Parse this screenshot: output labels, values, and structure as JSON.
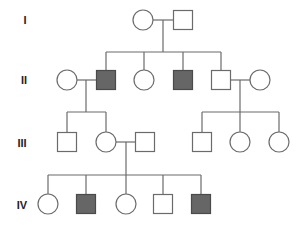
{
  "diagram": {
    "type": "pedigree",
    "colors": {
      "line": "#6b6b6b",
      "affected_fill": "#666666",
      "unaffected_fill": "#ffffff",
      "label": "#222222"
    },
    "generation_labels": [
      {
        "label": "I",
        "x": 25,
        "y": 20
      },
      {
        "label": "II",
        "x": 24,
        "y": 80
      },
      {
        "label": "III",
        "x": 22,
        "y": 143
      },
      {
        "label": "IV",
        "x": 22,
        "y": 205
      }
    ],
    "individuals": [
      {
        "id": "I-1",
        "sex": "female",
        "affected": false,
        "x": 143,
        "y": 20
      },
      {
        "id": "I-2",
        "sex": "male",
        "affected": false,
        "x": 183,
        "y": 20
      },
      {
        "id": "II-1",
        "sex": "female",
        "affected": false,
        "x": 67,
        "y": 80
      },
      {
        "id": "II-2",
        "sex": "male",
        "affected": true,
        "x": 106,
        "y": 80
      },
      {
        "id": "II-3",
        "sex": "female",
        "affected": false,
        "x": 144,
        "y": 80
      },
      {
        "id": "II-4",
        "sex": "male",
        "affected": true,
        "x": 183,
        "y": 80
      },
      {
        "id": "II-5",
        "sex": "male",
        "affected": false,
        "x": 221,
        "y": 80
      },
      {
        "id": "II-6",
        "sex": "female",
        "affected": false,
        "x": 260,
        "y": 80
      },
      {
        "id": "III-1",
        "sex": "male",
        "affected": false,
        "x": 67,
        "y": 142
      },
      {
        "id": "III-2",
        "sex": "female",
        "affected": false,
        "x": 106,
        "y": 142
      },
      {
        "id": "III-3",
        "sex": "male",
        "affected": false,
        "x": 145,
        "y": 142
      },
      {
        "id": "III-4",
        "sex": "male",
        "affected": false,
        "x": 202,
        "y": 142
      },
      {
        "id": "III-5",
        "sex": "female",
        "affected": false,
        "x": 240,
        "y": 142
      },
      {
        "id": "III-6",
        "sex": "female",
        "affected": false,
        "x": 279,
        "y": 142
      },
      {
        "id": "IV-1",
        "sex": "female",
        "affected": false,
        "x": 48,
        "y": 204
      },
      {
        "id": "IV-2",
        "sex": "male",
        "affected": true,
        "x": 86,
        "y": 204
      },
      {
        "id": "IV-3",
        "sex": "female",
        "affected": false,
        "x": 126,
        "y": 204
      },
      {
        "id": "IV-4",
        "sex": "male",
        "affected": false,
        "x": 163,
        "y": 204
      },
      {
        "id": "IV-5",
        "sex": "male",
        "affected": true,
        "x": 201,
        "y": 204
      }
    ],
    "lines": [
      {
        "name": "marriage-I",
        "x1": 153,
        "y1": 20,
        "x2": 173,
        "y2": 20
      },
      {
        "name": "descent-I",
        "x1": 163,
        "y1": 20,
        "x2": 163,
        "y2": 52
      },
      {
        "name": "sibship-II",
        "x1": 106,
        "y1": 52,
        "x2": 221,
        "y2": 52
      },
      {
        "name": "drop-II-2",
        "x1": 106,
        "y1": 52,
        "x2": 106,
        "y2": 71
      },
      {
        "name": "drop-II-3",
        "x1": 144,
        "y1": 52,
        "x2": 144,
        "y2": 70
      },
      {
        "name": "drop-II-4",
        "x1": 183,
        "y1": 52,
        "x2": 183,
        "y2": 71
      },
      {
        "name": "drop-II-5",
        "x1": 221,
        "y1": 52,
        "x2": 221,
        "y2": 71
      },
      {
        "name": "marriage-II-1-2",
        "x1": 77,
        "y1": 80,
        "x2": 97,
        "y2": 80
      },
      {
        "name": "descent-II-1-2",
        "x1": 86,
        "y1": 80,
        "x2": 86,
        "y2": 112
      },
      {
        "name": "sibship-III-left",
        "x1": 67,
        "y1": 112,
        "x2": 106,
        "y2": 112
      },
      {
        "name": "drop-III-1",
        "x1": 67,
        "y1": 112,
        "x2": 67,
        "y2": 133
      },
      {
        "name": "drop-III-2",
        "x1": 106,
        "y1": 112,
        "x2": 106,
        "y2": 132
      },
      {
        "name": "marriage-II-5-6",
        "x1": 230,
        "y1": 80,
        "x2": 250,
        "y2": 80
      },
      {
        "name": "descent-II-5-6",
        "x1": 240,
        "y1": 80,
        "x2": 240,
        "y2": 112
      },
      {
        "name": "sibship-III-right",
        "x1": 202,
        "y1": 112,
        "x2": 279,
        "y2": 112
      },
      {
        "name": "drop-III-4",
        "x1": 202,
        "y1": 112,
        "x2": 202,
        "y2": 133
      },
      {
        "name": "drop-III-5",
        "x1": 240,
        "y1": 112,
        "x2": 240,
        "y2": 132
      },
      {
        "name": "drop-III-6",
        "x1": 279,
        "y1": 112,
        "x2": 279,
        "y2": 132
      },
      {
        "name": "marriage-III-2-3",
        "x1": 116,
        "y1": 142,
        "x2": 136,
        "y2": 142
      },
      {
        "name": "descent-III-2-3",
        "x1": 126,
        "y1": 142,
        "x2": 126,
        "y2": 175
      },
      {
        "name": "sibship-IV",
        "x1": 48,
        "y1": 175,
        "x2": 201,
        "y2": 175
      },
      {
        "name": "drop-IV-1",
        "x1": 48,
        "y1": 175,
        "x2": 48,
        "y2": 194
      },
      {
        "name": "drop-IV-2",
        "x1": 86,
        "y1": 175,
        "x2": 86,
        "y2": 195
      },
      {
        "name": "drop-IV-3",
        "x1": 126,
        "y1": 175,
        "x2": 126,
        "y2": 194
      },
      {
        "name": "drop-IV-4",
        "x1": 163,
        "y1": 175,
        "x2": 163,
        "y2": 195
      },
      {
        "name": "drop-IV-5",
        "x1": 201,
        "y1": 175,
        "x2": 201,
        "y2": 195
      }
    ],
    "symbol_size": 19,
    "circle_radius": 10
  }
}
